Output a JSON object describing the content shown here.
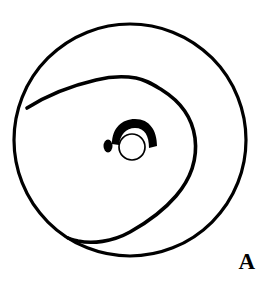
{
  "figure": {
    "panel_label": "A",
    "caption_text": "",
    "background_color": "#ffffff",
    "stroke_color": "#000000",
    "fill_color": "#000000",
    "width_px": 269,
    "height_px": 293
  },
  "elements": {
    "outer_boundary": {
      "name": "outer circular boundary",
      "shape": "circle",
      "center_x": 130,
      "center_y": 140,
      "radius": 116,
      "stroke_width": 3.2,
      "fill": "none"
    },
    "spiral_curve": {
      "name": "inward spiral contour",
      "shape": "open-spiral-curve",
      "stroke_width": 3.6,
      "fill": "none",
      "start_point_x": 27,
      "start_point_y": 108,
      "end_point_x": 68,
      "end_point_y": 238,
      "max_right_x": 196,
      "min_top_y": 78
    },
    "crescent": {
      "name": "filled crescent hook",
      "shape": "filled-crescent",
      "center_x": 134,
      "center_y": 142,
      "outer_radius": 22,
      "inner_radius": 14,
      "start_angle_deg": 183,
      "end_angle_deg": 25,
      "fill": "#000000"
    },
    "open_circle": {
      "name": "small open circle",
      "shape": "circle",
      "center_x": 132,
      "center_y": 147,
      "radius": 13,
      "stroke_width": 1.7,
      "fill": "#ffffff"
    },
    "oval_dot": {
      "name": "small filled oval dot",
      "shape": "ellipse",
      "center_x": 108,
      "center_y": 146,
      "radius_x": 4.5,
      "radius_y": 6.5,
      "fill": "#000000"
    }
  }
}
